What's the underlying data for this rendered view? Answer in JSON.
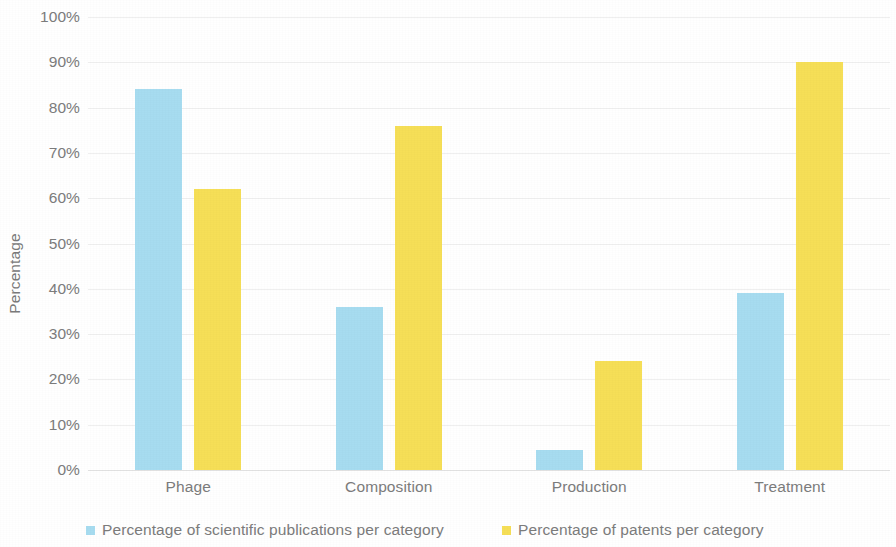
{
  "chart_data": {
    "type": "bar",
    "title": "",
    "subtitle": "",
    "xlabel": "",
    "ylabel": "Percentage",
    "categories": [
      "Phage",
      "Composition",
      "Production",
      "Treatment"
    ],
    "series": [
      {
        "name": "Percentage of scientific publications per category",
        "color": "#A7DCF0",
        "values": [
          84,
          36,
          4.5,
          39
        ]
      },
      {
        "name": "Percentage of patents per category",
        "color": "#F6DF57",
        "values": [
          62,
          76,
          24,
          90
        ]
      }
    ],
    "ylim": [
      0,
      100
    ],
    "ytick_values": [
      0,
      10,
      20,
      30,
      40,
      50,
      60,
      70,
      80,
      90,
      100
    ],
    "ytick_labels": [
      "0%",
      "10%",
      "20%",
      "30%",
      "40%",
      "50%",
      "60%",
      "70%",
      "80%",
      "90%",
      "100%"
    ],
    "grid": true,
    "grid_axis": "y",
    "legend_position": "bottom",
    "value_format": "percent"
  },
  "axis": {
    "y_title": "Percentage",
    "ticks": [
      {
        "label": "100%",
        "value": 100
      },
      {
        "label": "90%",
        "value": 90
      },
      {
        "label": "80%",
        "value": 80
      },
      {
        "label": "70%",
        "value": 70
      },
      {
        "label": "60%",
        "value": 60
      },
      {
        "label": "50%",
        "value": 50
      },
      {
        "label": "40%",
        "value": 40
      },
      {
        "label": "30%",
        "value": 30
      },
      {
        "label": "20%",
        "value": 20
      },
      {
        "label": "10%",
        "value": 10
      },
      {
        "label": "0%",
        "value": 0
      }
    ]
  },
  "categories": [
    {
      "label": "Phage"
    },
    {
      "label": "Composition"
    },
    {
      "label": "Production"
    },
    {
      "label": "Treatment"
    }
  ],
  "legend": {
    "items": [
      {
        "label": "Percentage of scientific publications per category",
        "color": "#A7DCF0"
      },
      {
        "label": "Percentage of patents per category",
        "color": "#F6DF57"
      }
    ]
  },
  "colors": {
    "series_publications": "#A7DCF0",
    "series_patents": "#F6DF57",
    "gridline": "#EFEFEF",
    "text": "#7C7C7C",
    "background": "#FFFFFF"
  }
}
